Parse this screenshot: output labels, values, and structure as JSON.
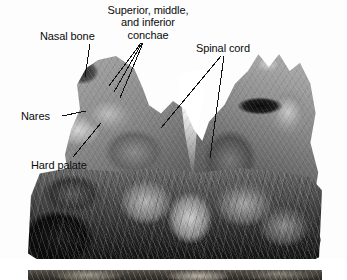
{
  "figure": {
    "kind": "anatomical-photograph",
    "width": 347,
    "height": 280,
    "background_color": "#ffffff",
    "label_color": "#0b0b0b",
    "leader_line_color": "#111111"
  },
  "labels": {
    "nasal_bone": "Nasal bone",
    "conchae_line1": "Superior, middle,",
    "conchae_line2": "and inferior",
    "conchae_line3": "conchae",
    "spinal_cord": "Spinal cord",
    "nares": "Nares",
    "hard_palate": "Hard palate"
  },
  "plates": {
    "main": {
      "name": "main-photograph"
    },
    "strip": {
      "name": "adjacent-photograph-strip"
    }
  }
}
